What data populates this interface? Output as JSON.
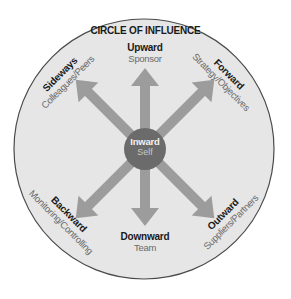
{
  "diagram": {
    "title": "CIRCLE OF INFLUENCE",
    "center": {
      "title": "Inward",
      "subtitle": "Self"
    },
    "directions": [
      {
        "id": "upward",
        "title": "Upward",
        "subtitle": "Sponsor"
      },
      {
        "id": "forward",
        "title": "Forward",
        "subtitle": "Strategy/Objectives"
      },
      {
        "id": "outward",
        "title": "Outward",
        "subtitle": "Suppliers/Partners"
      },
      {
        "id": "downward",
        "title": "Downward",
        "subtitle": "Team"
      },
      {
        "id": "backward",
        "title": "Backward",
        "subtitle": "Monitoring/Controlling"
      },
      {
        "id": "sideways",
        "title": "Sideways",
        "subtitle": "Colleagues/Peers"
      }
    ],
    "colors": {
      "circle_fill": "#e6e6e6",
      "circle_stroke": "#4a4a4a",
      "arrow": "#9c9c9c",
      "center_fill": "#6b6b6b",
      "title_text": "#1a1a1a",
      "subtitle_text": "#6a6a6a"
    }
  }
}
